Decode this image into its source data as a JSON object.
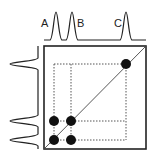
{
  "diagram": {
    "type": "2D NMR COSY-style spectrum",
    "peak_labels": [
      "A",
      "B",
      "C"
    ],
    "label_positions": {
      "A": [
        41,
        17
      ],
      "B": [
        77,
        17
      ],
      "C": [
        114,
        17
      ]
    },
    "cross_peaks": [
      [
        54,
        121
      ],
      [
        71,
        121
      ],
      [
        54,
        140
      ],
      [
        71,
        140
      ]
    ],
    "diagonal_peaks": [
      [
        54,
        140
      ],
      [
        71,
        121
      ],
      [
        126,
        64
      ]
    ],
    "colors": {
      "stroke": "#222222",
      "dots": "#111111",
      "dotted": "#555555"
    }
  }
}
